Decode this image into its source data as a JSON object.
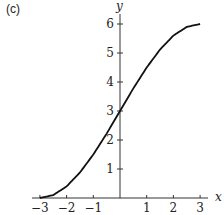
{
  "panel_label": "(c)",
  "chart_data": {
    "type": "line",
    "title": "",
    "xlabel": "x",
    "ylabel": "y",
    "xlim": [
      -3,
      3
    ],
    "ylim": [
      0,
      6
    ],
    "grid": false,
    "legend": null,
    "x_ticks": [
      -3,
      -2,
      -1,
      1,
      2,
      3
    ],
    "x_tick_labels": [
      "−3",
      "−2",
      "−1",
      "1",
      "2",
      "3"
    ],
    "y_ticks": [
      1,
      2,
      3,
      4,
      5,
      6
    ],
    "y_tick_labels": [
      "1",
      "2",
      "3",
      "4",
      "5",
      "6"
    ],
    "series": [
      {
        "name": "y(x)",
        "x": [
          -3,
          -2.5,
          -2,
          -1.5,
          -1,
          -0.5,
          0,
          0.5,
          1,
          1.5,
          2,
          2.5,
          3
        ],
        "y": [
          0,
          0.1,
          0.4,
          0.88,
          1.5,
          2.22,
          3.0,
          3.78,
          4.5,
          5.12,
          5.6,
          5.9,
          6.0
        ]
      }
    ]
  }
}
